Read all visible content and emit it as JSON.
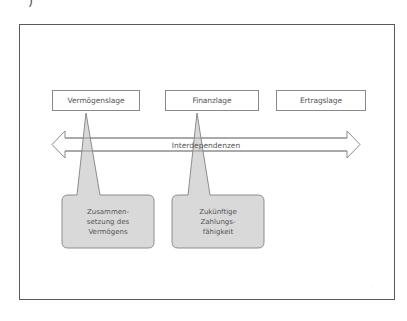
{
  "corner_mark": ")",
  "diagram": {
    "boxes": [
      {
        "id": "vermoegenslage",
        "label": "Vermögenslage"
      },
      {
        "id": "finanzlage",
        "label": "Finanzlage"
      },
      {
        "id": "ertragslage",
        "label": "Ertragslage"
      }
    ],
    "arrow": {
      "label": "Interdependenzen",
      "direction": "bidirectional"
    },
    "callouts": [
      {
        "points_to": "vermoegenslage",
        "text": "Zusammen-\nsetzung des\nVermögens"
      },
      {
        "points_to": "finanzlage",
        "text": "Zukünftige\nZahlungs-\nfähigkeit"
      }
    ],
    "colors": {
      "frame_border": "#5a5a5a",
      "box_border": "#8a8a8a",
      "callout_fill": "#d9d9d9",
      "callout_border": "#8c8c8c",
      "text": "#555555"
    }
  },
  "page_marker": "·"
}
